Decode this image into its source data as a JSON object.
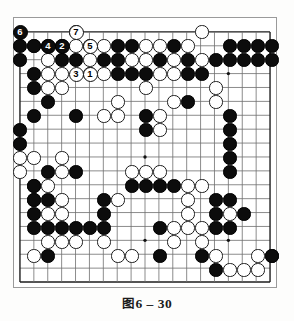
{
  "figure": {
    "caption_cjk": "图",
    "caption_num": "6 – 30",
    "caption_full": "图 6 – 30"
  },
  "board": {
    "size": 19,
    "label": "go-board-19x19",
    "origin_x": 19,
    "origin_y": 31,
    "spacing": 14,
    "stone_radius": 6.6,
    "line_color": "#6e6e6e",
    "edge_color": "#1d1d1d",
    "black_color": "#0c0c0c",
    "white_color": "#ffffff",
    "star_points": [
      [
        3,
        3
      ],
      [
        9,
        3
      ],
      [
        15,
        3
      ],
      [
        3,
        9
      ],
      [
        9,
        9
      ],
      [
        15,
        9
      ],
      [
        3,
        15
      ],
      [
        9,
        15
      ],
      [
        15,
        15
      ]
    ],
    "visible_rows": 18,
    "black_stones": [
      [
        0,
        1
      ],
      [
        1,
        1
      ],
      [
        2,
        1
      ],
      [
        3,
        1
      ],
      [
        5,
        1
      ],
      [
        7,
        1
      ],
      [
        8,
        1
      ],
      [
        11,
        1
      ],
      [
        15,
        1
      ],
      [
        16,
        1
      ],
      [
        17,
        1
      ],
      [
        18,
        1
      ],
      [
        0,
        2
      ],
      [
        3,
        2
      ],
      [
        4,
        2
      ],
      [
        6,
        2
      ],
      [
        7,
        2
      ],
      [
        10,
        2
      ],
      [
        12,
        2
      ],
      [
        14,
        2
      ],
      [
        15,
        2
      ],
      [
        16,
        2
      ],
      [
        17,
        2
      ],
      [
        18,
        2
      ],
      [
        1,
        3
      ],
      [
        7,
        3
      ],
      [
        8,
        3
      ],
      [
        9,
        3
      ],
      [
        12,
        3
      ],
      [
        13,
        3
      ],
      [
        1,
        4
      ],
      [
        2,
        5
      ],
      [
        12,
        5
      ],
      [
        1,
        6
      ],
      [
        4,
        6
      ],
      [
        9,
        6
      ],
      [
        15,
        6
      ],
      [
        0,
        7
      ],
      [
        9,
        7
      ],
      [
        15,
        7
      ],
      [
        0,
        8
      ],
      [
        15,
        8
      ],
      [
        15,
        9
      ],
      [
        2,
        10
      ],
      [
        4,
        10
      ],
      [
        15,
        10
      ],
      [
        1,
        11
      ],
      [
        8,
        11
      ],
      [
        9,
        11
      ],
      [
        10,
        11
      ],
      [
        11,
        11
      ],
      [
        1,
        12
      ],
      [
        2,
        12
      ],
      [
        6,
        12
      ],
      [
        14,
        12
      ],
      [
        15,
        12
      ],
      [
        1,
        13
      ],
      [
        6,
        13
      ],
      [
        14,
        13
      ],
      [
        16,
        13
      ],
      [
        1,
        14
      ],
      [
        2,
        14
      ],
      [
        3,
        14
      ],
      [
        4,
        14
      ],
      [
        5,
        14
      ],
      [
        6,
        14
      ],
      [
        10,
        14
      ],
      [
        14,
        14
      ],
      [
        15,
        14
      ],
      [
        2,
        16
      ],
      [
        10,
        16
      ],
      [
        13,
        16
      ],
      [
        18,
        16
      ],
      [
        14,
        17
      ]
    ],
    "white_stones": [
      [
        4,
        0
      ],
      [
        13,
        0
      ],
      [
        1,
        1
      ],
      [
        4,
        1
      ],
      [
        6,
        1
      ],
      [
        9,
        1
      ],
      [
        10,
        1
      ],
      [
        12,
        1
      ],
      [
        2,
        2
      ],
      [
        5,
        2
      ],
      [
        8,
        2
      ],
      [
        9,
        2
      ],
      [
        11,
        2
      ],
      [
        13,
        2
      ],
      [
        2,
        3
      ],
      [
        3,
        3
      ],
      [
        5,
        3
      ],
      [
        6,
        3
      ],
      [
        10,
        3
      ],
      [
        11,
        3
      ],
      [
        2,
        4
      ],
      [
        3,
        4
      ],
      [
        9,
        4
      ],
      [
        14,
        4
      ],
      [
        7,
        5
      ],
      [
        11,
        5
      ],
      [
        14,
        5
      ],
      [
        6,
        6
      ],
      [
        7,
        6
      ],
      [
        10,
        6
      ],
      [
        10,
        7
      ],
      [
        0,
        9
      ],
      [
        1,
        9
      ],
      [
        3,
        9
      ],
      [
        0,
        10
      ],
      [
        3,
        10
      ],
      [
        8,
        10
      ],
      [
        9,
        10
      ],
      [
        10,
        10
      ],
      [
        1,
        11
      ],
      [
        2,
        11
      ],
      [
        12,
        11
      ],
      [
        13,
        11
      ],
      [
        1,
        12
      ],
      [
        3,
        12
      ],
      [
        7,
        12
      ],
      [
        12,
        12
      ],
      [
        2,
        13
      ],
      [
        3,
        13
      ],
      [
        12,
        13
      ],
      [
        15,
        13
      ],
      [
        11,
        14
      ],
      [
        12,
        14
      ],
      [
        13,
        14
      ],
      [
        2,
        15
      ],
      [
        3,
        15
      ],
      [
        4,
        15
      ],
      [
        6,
        15
      ],
      [
        11,
        15
      ],
      [
        13,
        15
      ],
      [
        1,
        16
      ],
      [
        7,
        16
      ],
      [
        8,
        16
      ],
      [
        14,
        16
      ],
      [
        17,
        16
      ],
      [
        18,
        16
      ],
      [
        15,
        17
      ],
      [
        16,
        17
      ],
      [
        17,
        17
      ]
    ],
    "numbered_moves": [
      {
        "label": "1",
        "color": "w",
        "col": 5,
        "row": 3
      },
      {
        "label": "2",
        "color": "b",
        "col": 3,
        "row": 1
      },
      {
        "label": "3",
        "color": "w",
        "col": 4,
        "row": 3
      },
      {
        "label": "4",
        "color": "b",
        "col": 2,
        "row": 1
      },
      {
        "label": "5",
        "color": "w",
        "col": 5,
        "row": 1
      },
      {
        "label": "6",
        "color": "b",
        "col": 0,
        "row": 0
      },
      {
        "label": "7",
        "color": "w",
        "col": 4,
        "row": 0
      }
    ]
  }
}
